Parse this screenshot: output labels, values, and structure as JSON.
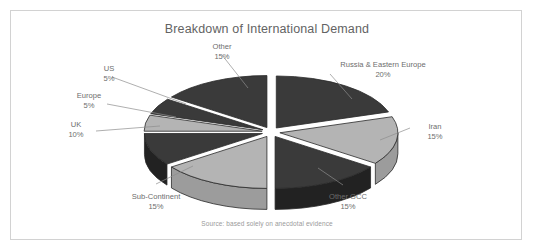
{
  "chart_data": {
    "type": "pie",
    "title": "Breakdown of International Demand",
    "source_note": "Source: based solely on anecdotal evidence",
    "exploded": true,
    "three_d": true,
    "legend": "none",
    "categories": [
      "Russia & Eastern Europe",
      "Iran",
      "Other GCC",
      "Sub-Continent",
      "UK",
      "Europe",
      "US",
      "Other"
    ],
    "values": [
      20,
      15,
      15,
      15,
      10,
      5,
      5,
      15
    ],
    "unit": "%",
    "slices": [
      {
        "label": "Russia & Eastern Europe",
        "pct": "20%",
        "value": 20,
        "fill": "#3a3a3a"
      },
      {
        "label": "Iran",
        "pct": "15%",
        "value": 15,
        "fill": "#b4b4b4"
      },
      {
        "label": "Other GCC",
        "pct": "15%",
        "value": 15,
        "fill": "#3a3a3a"
      },
      {
        "label": "Sub-Continent",
        "pct": "15%",
        "value": 15,
        "fill": "#b4b4b4"
      },
      {
        "label": "UK",
        "pct": "10%",
        "value": 10,
        "fill": "#3a3a3a"
      },
      {
        "label": "Europe",
        "pct": "5%",
        "value": 5,
        "fill": "#b4b4b4"
      },
      {
        "label": "US",
        "pct": "5%",
        "value": 5,
        "fill": "#3a3a3a"
      },
      {
        "label": "Other",
        "pct": "15%",
        "value": 15,
        "fill": "#3a3a3a"
      }
    ],
    "colors": {
      "dark_slice": "#3a3a3a",
      "light_slice": "#b4b4b4",
      "dark_wall": "#2c2c2c",
      "light_wall": "#a0a0a0",
      "outline": "#2a2a2a",
      "leader_line": "#8d8d8d",
      "text": "#6d6d6d",
      "border": "#d2d2d2",
      "background": "#ffffff"
    }
  },
  "labels": {
    "other": {
      "name": "Other",
      "pct": "15%"
    },
    "us": {
      "name": "US",
      "pct": "5%"
    },
    "europe": {
      "name": "Europe",
      "pct": "5%"
    },
    "uk": {
      "name": "UK",
      "pct": "10%"
    },
    "subcont": {
      "name": "Sub-Continent",
      "pct": "15%"
    },
    "gcc": {
      "name": "Other GCC",
      "pct": "15%"
    },
    "iran": {
      "name": "Iran",
      "pct": "15%"
    },
    "russia": {
      "name": "Russia & Eastern Europe",
      "pct": "20%"
    }
  }
}
